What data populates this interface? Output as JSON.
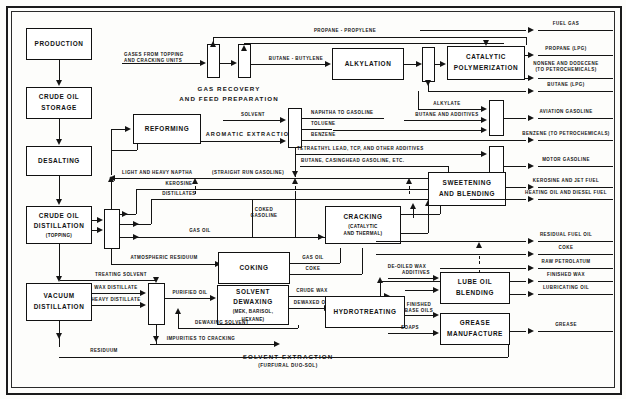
{
  "diagram": {
    "type": "process-flow-diagram",
    "colors": {
      "line": "#141414",
      "box_fill": "#ffffff",
      "background": "#fdfdfb",
      "frame": "#1b1b1b"
    }
  },
  "units": {
    "production": "PRODUCTION",
    "crude_oil_storage_l1": "CRUDE OIL",
    "crude_oil_storage_l2": "STORAGE",
    "desalting": "DESALTING",
    "crude_oil_distillation_l1": "CRUDE OIL",
    "crude_oil_distillation_l2": "DISTILLATION",
    "crude_oil_distillation_l3": "(TOPPING)",
    "vacuum_distillation_l1": "VACUUM",
    "vacuum_distillation_l2": "DISTILLATION",
    "reforming": "REFORMING",
    "alkylation": "ALKYLATION",
    "catalytic_polymerization_l1": "CATALYTIC",
    "catalytic_polymerization_l2": "POLYMERIZATION",
    "sweetening_l1": "SWEETENING",
    "sweetening_l2": "AND BLENDING",
    "cracking_l1": "CRACKING",
    "cracking_l2": "(CATALYTIC",
    "cracking_l3": "AND THERMAL)",
    "coking": "COKING",
    "solvent_dewaxing_l1": "SOLVENT",
    "solvent_dewaxing_l2": "DEWAXING",
    "solvent_dewaxing_l3": "(MEK, BARISOL,",
    "solvent_dewaxing_l4": "HEXANE)",
    "hydrotreating": "HYDROTREATING",
    "lube_oil_blending_l1": "LUBE OIL",
    "lube_oil_blending_l2": "BLENDING",
    "grease_manufacture_l1": "GREASE",
    "grease_manufacture_l2": "MANUFACTURE"
  },
  "section_titles": {
    "gas_recovery_l1": "GAS RECOVERY",
    "gas_recovery_l2": "AND FEED PREPARATION",
    "aromatic_extraction": "AROMATIC  EXTRACTION",
    "solvent_extraction": "SOLVENT  EXTRACTION",
    "solvent_extraction_sub": "(FURFURAL DUO-SOL)"
  },
  "streams": {
    "gases_from_topping_l1": "GASES FROM TOPPING",
    "gases_from_topping_l2": "AND CRACKING UNITS",
    "propane_propylene": "PROPANE - PROPYLENE",
    "butane_butylene": "BUTANE - BUTYLENE",
    "alkylate": "ALKYLATE",
    "butane_and_additives": "BUTANE AND ADDITIVES",
    "solvent": "SOLVENT",
    "naphtha_to_gasoline": "NAPHTHA TO GASOLINE",
    "toluene": "TOLUENE",
    "benzene": "BENZENE",
    "tetraethyl": "TETRAETHYL LEAD, TCP, AND OTHER ADDITIVES",
    "butane_casinghead": "BUTANE, CASINGHEAD GASOLINE, ETC.",
    "light_heavy_naphtha": "LIGHT AND HEAVY NAPTHA",
    "straight_run_gasoline": "(STRAIGHT RUN GASOLINE)",
    "kerosine": "KEROSINE",
    "distillates": "DISTILLATES",
    "coked_gasoline_l1": "COKED",
    "coked_gasoline_l2": "GASOLINE",
    "gas_oil": "GAS OIL",
    "gas_oil_2": "GAS OIL",
    "coke_stream": "COKE",
    "atmospheric_residuum": "ATMOSPHERIC RESIDUUM",
    "treating_solvent": "TREATING SOLVENT",
    "wax_distillate": "WAX DISTILLATE",
    "heavy_distillate": "HEAVY DISTILLATE",
    "purified_oil": "PURIFIED OIL",
    "crude_wax": "CRUDE WAX",
    "dewaxed_oil": "DEWAXED OIL",
    "dewaxing_solvent": "DEWAXING SOLVENT",
    "impurities_to_cracking": "IMPURITIES TO CRACKING",
    "residuum": "RESIDUUM",
    "de_oiled_wax": "DE-OILED WAX",
    "additives": "ADDITIVES",
    "finished_base_oils_l1": "FINISHED",
    "finished_base_oils_l2": "BASE OILS",
    "soaps": "SOAPS"
  },
  "products": {
    "fuel_gas": "FUEL GAS",
    "propane_lpg": "PROPANE (LPG)",
    "nonene_dodecene_l1": "NONENE AND DODECENE",
    "nonene_dodecene_l2": "(TO PETROCHEMICALS)",
    "butane_lpg": "BUTANE (LPG)",
    "aviation_gasoline": "AVIATION GASOLINE",
    "benzene_petro": "BENZENE (TO PETROCHEMICALS)",
    "motor_gasoline": "MOTOR GASOLINE",
    "kerosine_jet_fuel": "KEROSINE AND JET FUEL",
    "heating_diesel": "HEATING OIL AND DIESEL FUEL",
    "residual_fuel_oil": "RESIDUAL FUEL OIL",
    "coke": "COKE",
    "raw_petrolatum": "RAW PETROLATUM",
    "finished_wax": "FINISHED WAX",
    "lubricating_oil": "LUBRICATING OIL",
    "grease": "GREASE"
  }
}
